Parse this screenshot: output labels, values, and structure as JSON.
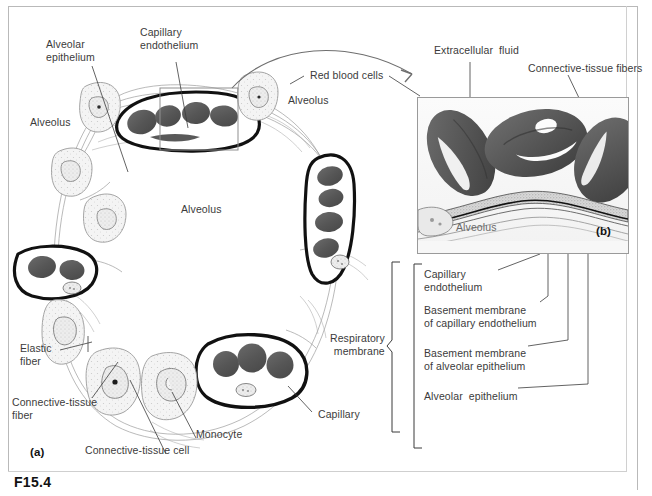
{
  "figure": {
    "id": "F15.4",
    "panel_a": "(a)",
    "panel_b": "(b)"
  },
  "colors": {
    "rbc_fill": "#585858",
    "rbc_dark": "#4a4a4a",
    "membrane": "#111111",
    "tissue_line": "#8d8d8d",
    "label_text": "#3b3b3b",
    "frame": "#b9b9b9",
    "background": "#ffffff"
  },
  "panel_a_labels": {
    "alveolar_epithelium": "Alveolar\nepithelium",
    "capillary_endothelium": "Capillary\nendothelium",
    "red_blood_cells": "Red blood cells",
    "alveolus_left": "Alveolus",
    "alveolus_top_right": "Alveolus",
    "alveolus_center": "Alveolus",
    "elastic_fiber": "Elastic\nfiber",
    "connective_tissue_fiber": "Connective-tissue\nfiber",
    "connective_tissue_cell": "Connective-tissue cell",
    "monocyte": "Monocyte",
    "capillary": "Capillary",
    "respiratory_membrane": "Respiratory\nmembrane"
  },
  "panel_b_labels": {
    "extracellular_fluid": "Extracellular  fluid",
    "connective_tissue_fibers": "Connective-tissue fibers",
    "alveolus": "Alveolus"
  },
  "respiratory_membrane_layers": [
    "Capillary\nendothelium",
    "Basement membrane\nof capillary endothelium",
    "Basement membrane\nof alveolar epithelium",
    "Alveolar  epithelium"
  ],
  "diagram_meta": {
    "type": "anatomical-illustration",
    "subject": "Alveolar and capillary structure of the respiratory membrane",
    "panels": 2
  }
}
